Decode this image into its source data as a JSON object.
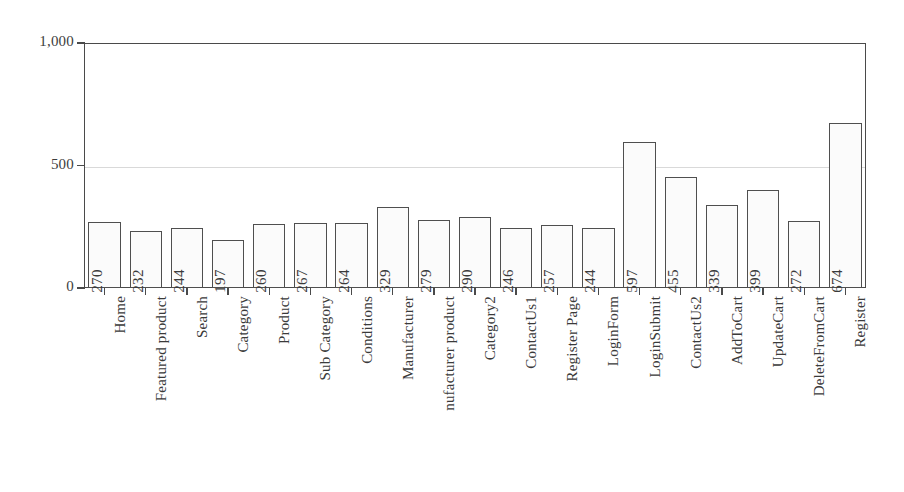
{
  "chart_data": {
    "type": "bar",
    "title": "",
    "subtitle": "",
    "xlabel": "",
    "ylabel": "",
    "ylim": [
      0,
      1000
    ],
    "y_ticks": [
      0,
      500,
      1000
    ],
    "y_tick_labels": [
      "0",
      "500",
      "1,000"
    ],
    "grid": "horizontal-faint-at-500",
    "legend": "none",
    "orientation": "vertical",
    "value_labels": "inside-bar-rotated-90",
    "category_label_rotation": "-90",
    "categories": [
      "Home",
      "Featured product",
      "Search",
      "Category",
      "Product",
      "Sub Category",
      "Conditions",
      "Manufacturer",
      "nufacturer product",
      "Category2",
      "ContactUs1",
      "Register Page",
      "LoginForm",
      "LoginSubmit",
      "ContactUs2",
      "AddToCart",
      "UpdateCart",
      "DeleteFromCart",
      "Register"
    ],
    "values": [
      270,
      232,
      244,
      197,
      260,
      267,
      264,
      329,
      279,
      290,
      246,
      257,
      244,
      597,
      455,
      339,
      399,
      272,
      674
    ]
  },
  "style": {
    "background": "#ffffff",
    "axis_color": "#4a4a4a",
    "bar_fill": "#fbfbfb",
    "bar_border": "#4f4f4f",
    "gridline_color": "#d9d9d9",
    "text_color": "#3a3a3a"
  }
}
